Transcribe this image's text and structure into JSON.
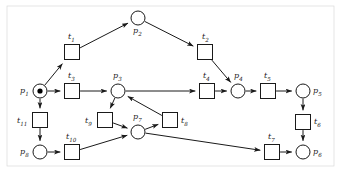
{
  "diagram": {
    "kind": "petri-net",
    "colors": {
      "stroke": "#1a1a1a",
      "fill": "#ffffff",
      "token": "#000000",
      "frame": "#d9d9d9",
      "background": "#ffffff"
    },
    "geometry": {
      "place_radius": 7,
      "transition_size": 15,
      "token_radius": 2.6,
      "stroke_width": 1
    },
    "places": [
      {
        "id": "p1",
        "label": "p",
        "sub": "1",
        "x": 40,
        "y": 91,
        "tokens": 1,
        "label_dx": -20,
        "label_dy": -4
      },
      {
        "id": "p2",
        "label": "p",
        "sub": "2",
        "x": 138,
        "y": 18,
        "tokens": 0,
        "label_dx": -5,
        "label_dy": 9
      },
      {
        "id": "p3",
        "label": "p",
        "sub": "3",
        "x": 118,
        "y": 91,
        "tokens": 0,
        "label_dx": -5,
        "label_dy": -19
      },
      {
        "id": "p4",
        "label": "p",
        "sub": "4",
        "x": 238,
        "y": 91,
        "tokens": 0,
        "label_dx": -4,
        "label_dy": -19
      },
      {
        "id": "p5",
        "label": "p",
        "sub": "5",
        "x": 303,
        "y": 91,
        "tokens": 0,
        "label_dx": 10,
        "label_dy": -4
      },
      {
        "id": "p6",
        "label": "p",
        "sub": "6",
        "x": 303,
        "y": 152,
        "tokens": 0,
        "label_dx": 10,
        "label_dy": -4
      },
      {
        "id": "p7",
        "label": "p",
        "sub": "7",
        "x": 138,
        "y": 132,
        "tokens": 0,
        "label_dx": -5,
        "label_dy": -19
      },
      {
        "id": "p8",
        "label": "p",
        "sub": "8",
        "x": 40,
        "y": 152,
        "tokens": 0,
        "label_dx": -20,
        "label_dy": -4
      }
    ],
    "transitions": [
      {
        "id": "t1",
        "label": "t",
        "sub": "1",
        "x": 72,
        "y": 52,
        "label_dx": -4,
        "label_dy": -19
      },
      {
        "id": "t2",
        "label": "t",
        "sub": "2",
        "x": 205,
        "y": 52,
        "label_dx": -3,
        "label_dy": -19
      },
      {
        "id": "t3",
        "label": "t",
        "sub": "3",
        "x": 72,
        "y": 91,
        "label_dx": -4,
        "label_dy": -19
      },
      {
        "id": "t4",
        "label": "t",
        "sub": "4",
        "x": 207,
        "y": 91,
        "label_dx": -4,
        "label_dy": -19
      },
      {
        "id": "t5",
        "label": "t",
        "sub": "5",
        "x": 268,
        "y": 91,
        "label_dx": -4,
        "label_dy": -19
      },
      {
        "id": "t6",
        "label": "t",
        "sub": "6",
        "x": 303,
        "y": 122,
        "label_dx": 11,
        "label_dy": -4
      },
      {
        "id": "t7",
        "label": "t",
        "sub": "7",
        "x": 272,
        "y": 152,
        "label_dx": -4,
        "label_dy": -19
      },
      {
        "id": "t8",
        "label": "t",
        "sub": "8",
        "x": 170,
        "y": 120,
        "label_dx": 11,
        "label_dy": -3
      },
      {
        "id": "t9",
        "label": "t",
        "sub": "9",
        "x": 105,
        "y": 120,
        "label_dx": -20,
        "label_dy": -3
      },
      {
        "id": "t10",
        "label": "t",
        "sub": "10",
        "x": 72,
        "y": 152,
        "label_dx": -6,
        "label_dy": -19
      },
      {
        "id": "t11",
        "label": "t",
        "sub": "11",
        "x": 40,
        "y": 120,
        "label_dx": -23,
        "label_dy": -3
      }
    ],
    "arcs": [
      {
        "from": "p1",
        "to": "t1",
        "name": "arc-p1-t1"
      },
      {
        "from": "t1",
        "to": "p2",
        "name": "arc-t1-p2"
      },
      {
        "from": "p2",
        "to": "t2",
        "name": "arc-p2-t2"
      },
      {
        "from": "t2",
        "to": "p4",
        "name": "arc-t2-p4"
      },
      {
        "from": "p1",
        "to": "t3",
        "name": "arc-p1-t3"
      },
      {
        "from": "t3",
        "to": "p3",
        "name": "arc-t3-p3"
      },
      {
        "from": "p3",
        "to": "t4",
        "name": "arc-p3-t4"
      },
      {
        "from": "t4",
        "to": "p4",
        "name": "arc-t4-p4"
      },
      {
        "from": "p4",
        "to": "t5",
        "name": "arc-p4-t5"
      },
      {
        "from": "t5",
        "to": "p5",
        "name": "arc-t5-p5"
      },
      {
        "from": "p5",
        "to": "t6",
        "name": "arc-p5-t6"
      },
      {
        "from": "t6",
        "to": "p6",
        "name": "arc-t6-p6"
      },
      {
        "from": "p3",
        "to": "t9",
        "name": "arc-p3-t9"
      },
      {
        "from": "t9",
        "to": "p7",
        "name": "arc-t9-p7"
      },
      {
        "from": "p7",
        "to": "t8",
        "name": "arc-p7-t8"
      },
      {
        "from": "t8",
        "to": "p3",
        "name": "arc-t8-p3"
      },
      {
        "from": "p1",
        "to": "t11",
        "name": "arc-p1-t11"
      },
      {
        "from": "t11",
        "to": "p8",
        "name": "arc-t11-p8"
      },
      {
        "from": "p8",
        "to": "t10",
        "name": "arc-p8-t10"
      },
      {
        "from": "t10",
        "to": "p7",
        "name": "arc-t10-p7"
      },
      {
        "from": "p7",
        "to": "t7",
        "name": "arc-p7-t7"
      },
      {
        "from": "t7",
        "to": "p6",
        "name": "arc-t7-p6"
      }
    ],
    "frame": {
      "x": 7,
      "y": 6,
      "width": 327,
      "height": 160
    }
  }
}
